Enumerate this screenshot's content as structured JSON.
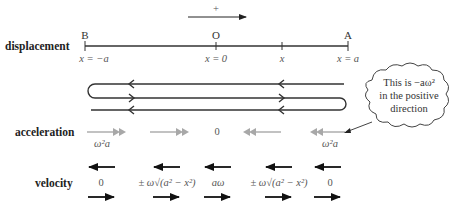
{
  "direction": {
    "label": "+"
  },
  "rows": {
    "displacement": "displacement",
    "acceleration": "acceleration",
    "velocity": "velocity"
  },
  "axis": {
    "points": [
      {
        "name": "B",
        "value": "x = −a"
      },
      {
        "name": "O",
        "value": "x = 0"
      },
      {
        "name": "",
        "value": "x"
      },
      {
        "name": "A",
        "value": "x = a"
      }
    ]
  },
  "acceleration": {
    "left_value": "ω²a",
    "middle_value": "0",
    "right_value": "ω²a"
  },
  "velocity": {
    "values": [
      "0",
      "± ω√(a² − x²)",
      "aω",
      "± ω√(a² − x²)",
      "0"
    ]
  },
  "callout": {
    "line1": "This is −aω²",
    "line2": "in the positive",
    "line3": "direction"
  },
  "colors": {
    "line": "#333333",
    "accel_arrow": "#a8a8a8",
    "velocity_arrow": "#111111"
  }
}
